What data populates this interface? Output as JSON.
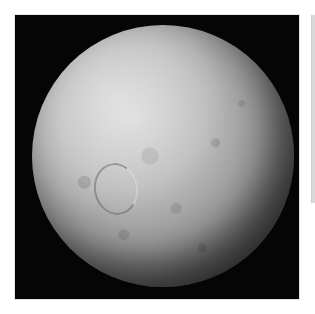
{
  "viewer": {
    "image": {
      "subject": "cratered grey moon against black space",
      "background_color": "#050505",
      "surface_color": "#bdbdbd"
    },
    "scrollbar": {
      "orientation": "vertical",
      "thumb_color": "#d9d9d9"
    }
  }
}
